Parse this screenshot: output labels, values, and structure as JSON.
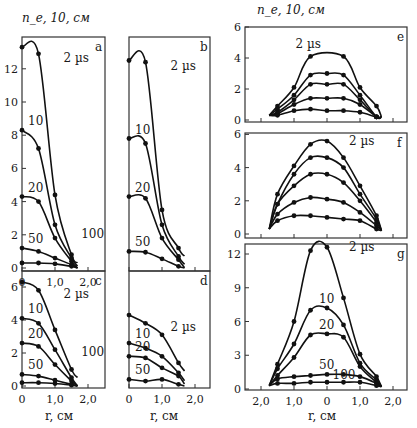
{
  "figure": {
    "ylabel_left": "n_e, 10^14, см^-3",
    "ylabel_right": "n_e, 10^14, см^-3",
    "xlabel": "r, см"
  },
  "chart_data": [
    {
      "panel": "a",
      "type": "line",
      "xlabel": "r, см",
      "ylabel": "n_e, 10^14, см^-3",
      "xlim": [
        0,
        2.5
      ],
      "ylim": [
        0,
        14
      ],
      "xticks": [
        "0",
        "1,0",
        "2,0"
      ],
      "yticks": [
        0,
        2,
        4,
        6,
        8,
        10,
        12
      ],
      "series": [
        {
          "name": "2 µs",
          "x": [
            0,
            0.5,
            1.0,
            1.5
          ],
          "y": [
            13.3,
            12.9,
            4.4,
            0.8
          ]
        },
        {
          "name": "10",
          "x": [
            0,
            0.5,
            1.0,
            1.5
          ],
          "y": [
            8.3,
            7.2,
            2.6,
            0.6
          ]
        },
        {
          "name": "20",
          "x": [
            0,
            0.5,
            1.0,
            1.5
          ],
          "y": [
            4.3,
            4.0,
            1.8,
            0.4
          ]
        },
        {
          "name": "50",
          "x": [
            0,
            0.5,
            1.0,
            1.5
          ],
          "y": [
            1.2,
            1.0,
            0.6,
            0.2
          ]
        },
        {
          "name": "100",
          "x": [
            0,
            0.5,
            1.0,
            1.5
          ],
          "y": [
            0.3,
            0.3,
            0.25,
            0.1
          ]
        }
      ]
    },
    {
      "panel": "b",
      "type": "line",
      "xlim": [
        0,
        2.5
      ],
      "ylim": [
        0,
        14
      ],
      "series": [
        {
          "name": "2 µs",
          "x": [
            0,
            0.5,
            1.0,
            1.5
          ],
          "y": [
            12.5,
            12.4,
            3.5,
            1.2
          ]
        },
        {
          "name": "10",
          "x": [
            0,
            0.5,
            1.0,
            1.5
          ],
          "y": [
            7.8,
            7.5,
            2.6,
            0.7
          ]
        },
        {
          "name": "20",
          "x": [
            0,
            0.5,
            1.0,
            1.5
          ],
          "y": [
            4.3,
            4.2,
            1.8,
            0.5
          ]
        },
        {
          "name": "50",
          "x": [
            0,
            0.5,
            1.0,
            1.5
          ],
          "y": [
            1.0,
            0.95,
            0.55,
            0.1
          ]
        }
      ]
    },
    {
      "panel": "c",
      "type": "line",
      "xlim": [
        0,
        2.5
      ],
      "ylim": [
        0,
        7
      ],
      "xticks": [
        "0",
        "1,0",
        "2,0"
      ],
      "yticks": [
        0,
        2,
        4,
        6
      ],
      "series": [
        {
          "name": "2 µs",
          "x": [
            0,
            0.5,
            1.0,
            1.5
          ],
          "y": [
            6.3,
            5.8,
            3.4,
            1.0
          ]
        },
        {
          "name": "10",
          "x": [
            0,
            0.5,
            1.0,
            1.5
          ],
          "y": [
            4.1,
            3.8,
            2.2,
            0.5
          ]
        },
        {
          "name": "20",
          "x": [
            0,
            0.5,
            1.0,
            1.5
          ],
          "y": [
            2.6,
            2.4,
            1.3,
            0.3
          ]
        },
        {
          "name": "50",
          "x": [
            0,
            0.5,
            1.0,
            1.5
          ],
          "y": [
            0.7,
            0.6,
            0.35,
            0.1
          ]
        },
        {
          "name": "100",
          "x": [
            0,
            0.5,
            1.0,
            1.5
          ],
          "y": [
            0.2,
            0.2,
            0.15,
            0.05
          ]
        }
      ]
    },
    {
      "panel": "d",
      "type": "line",
      "xlim": [
        0,
        2.5
      ],
      "ylim": [
        0,
        7
      ],
      "xticks": [
        "0",
        "1,0",
        "2,0"
      ],
      "series": [
        {
          "name": "2 µs",
          "x": [
            0,
            0.5,
            1.0,
            1.5
          ],
          "y": [
            4.3,
            3.8,
            3.1,
            1.4
          ]
        },
        {
          "name": "10",
          "x": [
            0,
            0.5,
            1.0,
            1.5
          ],
          "y": [
            2.6,
            2.3,
            1.8,
            0.8
          ]
        },
        {
          "name": "20",
          "x": [
            0,
            0.5,
            1.0,
            1.5
          ],
          "y": [
            1.8,
            1.7,
            1.1,
            0.6
          ]
        },
        {
          "name": "50",
          "x": [
            0,
            0.5,
            1.0,
            1.5
          ],
          "y": [
            0.4,
            0.3,
            0.4,
            0.1
          ]
        }
      ]
    },
    {
      "panel": "e",
      "type": "line",
      "xlim": [
        -2.5,
        2.5
      ],
      "ylim": [
        0,
        6
      ],
      "yticks": [
        0,
        2,
        4,
        6
      ],
      "series": [
        {
          "name": "2 µs",
          "x": [
            -1.5,
            -1.0,
            -0.5,
            0.5,
            1.0,
            1.5
          ],
          "y": [
            0.9,
            2.1,
            4.1,
            4.1,
            2.1,
            0.9
          ]
        },
        {
          "name": "10",
          "x": [
            -1.5,
            -1.0,
            -0.5,
            0,
            0.5,
            1.0,
            1.5
          ],
          "y": [
            0.7,
            1.6,
            2.9,
            3.0,
            2.9,
            1.6,
            0.2
          ]
        },
        {
          "name": "20",
          "x": [
            -1.5,
            -1.0,
            -0.5,
            0,
            0.5,
            1.0,
            1.5
          ],
          "y": [
            0.5,
            1.3,
            2.3,
            2.3,
            2.3,
            1.3,
            0.2
          ]
        },
        {
          "name": "50",
          "x": [
            -1.5,
            -1.0,
            -0.5,
            0,
            0.5,
            1.0,
            1.5
          ],
          "y": [
            0.4,
            1.0,
            1.4,
            1.4,
            1.4,
            1.0,
            0.2
          ]
        },
        {
          "name": "100",
          "x": [
            -1.5,
            -1.0,
            -0.5,
            0,
            0.5,
            1.0,
            1.5
          ],
          "y": [
            0.3,
            0.6,
            0.7,
            0.6,
            0.6,
            0.5,
            0.2
          ]
        }
      ]
    },
    {
      "panel": "f",
      "type": "line",
      "xlim": [
        -2.5,
        2.5
      ],
      "ylim": [
        0,
        6
      ],
      "yticks": [
        0,
        2,
        4,
        6
      ],
      "series": [
        {
          "name": "2 µs",
          "x": [
            -1.5,
            -1.0,
            -0.5,
            0,
            0.5,
            1.0,
            1.5
          ],
          "y": [
            2.4,
            4.1,
            5.4,
            5.6,
            4.6,
            2.9,
            1.1
          ]
        },
        {
          "name": "10",
          "x": [
            -1.5,
            -1.0,
            -0.5,
            0,
            0.5,
            1.0,
            1.5
          ],
          "y": [
            1.8,
            3.6,
            4.6,
            4.6,
            4.0,
            2.4,
            0.9
          ]
        },
        {
          "name": "20",
          "x": [
            -1.5,
            -1.0,
            -0.5,
            0,
            0.5,
            1.0,
            1.5
          ],
          "y": [
            1.8,
            2.9,
            3.6,
            3.6,
            3.1,
            2.0,
            0.7
          ]
        },
        {
          "name": "50",
          "x": [
            -1.5,
            -1.0,
            -0.5,
            0,
            0.5,
            1.0,
            1.5
          ],
          "y": [
            1.2,
            1.9,
            2.2,
            2.1,
            1.9,
            1.3,
            0.5
          ]
        },
        {
          "name": "100",
          "x": [
            -1.5,
            -1.0,
            -0.5,
            0,
            0.5,
            1.0,
            1.5
          ],
          "y": [
            0.8,
            1.1,
            1.1,
            1.0,
            0.9,
            0.8,
            0.3
          ]
        }
      ]
    },
    {
      "panel": "g",
      "type": "line",
      "xlabel": "r, см",
      "xlim": [
        -2.5,
        2.5
      ],
      "ylim": [
        0,
        13
      ],
      "xticks": [
        "2,0",
        "1,0",
        "0",
        "1,0",
        "2,0"
      ],
      "yticks": [
        0,
        3,
        6,
        9,
        12
      ],
      "series": [
        {
          "name": "2 µs",
          "x": [
            -1.5,
            -1.0,
            -0.5,
            0,
            0.5,
            1.0,
            1.5
          ],
          "y": [
            2.2,
            6.0,
            12.3,
            12.6,
            8.1,
            3.1,
            1.1
          ]
        },
        {
          "name": "10",
          "x": [
            -1.5,
            -1.0,
            -0.5,
            0,
            0.5,
            1.0,
            1.5
          ],
          "y": [
            1.8,
            4.0,
            7.0,
            7.2,
            5.7,
            2.3,
            0.8
          ]
        },
        {
          "name": "20",
          "x": [
            -1.5,
            -1.0,
            -0.5,
            0,
            0.5,
            1.0,
            1.5
          ],
          "y": [
            1.2,
            2.8,
            4.8,
            4.9,
            4.6,
            2.0,
            0.6
          ]
        },
        {
          "name": "50",
          "x": [
            -1.5,
            -1.0,
            -0.5,
            0,
            0.5,
            1.0,
            1.5
          ],
          "y": [
            0.9,
            1.1,
            1.2,
            1.3,
            1.3,
            1.1,
            0.5
          ]
        },
        {
          "name": "100",
          "x": [
            -1.5,
            -1.0,
            -0.5,
            0,
            0.5,
            1.0,
            1.5
          ],
          "y": [
            0.5,
            0.5,
            0.6,
            0.6,
            0.6,
            0.6,
            0.3
          ]
        }
      ]
    }
  ]
}
